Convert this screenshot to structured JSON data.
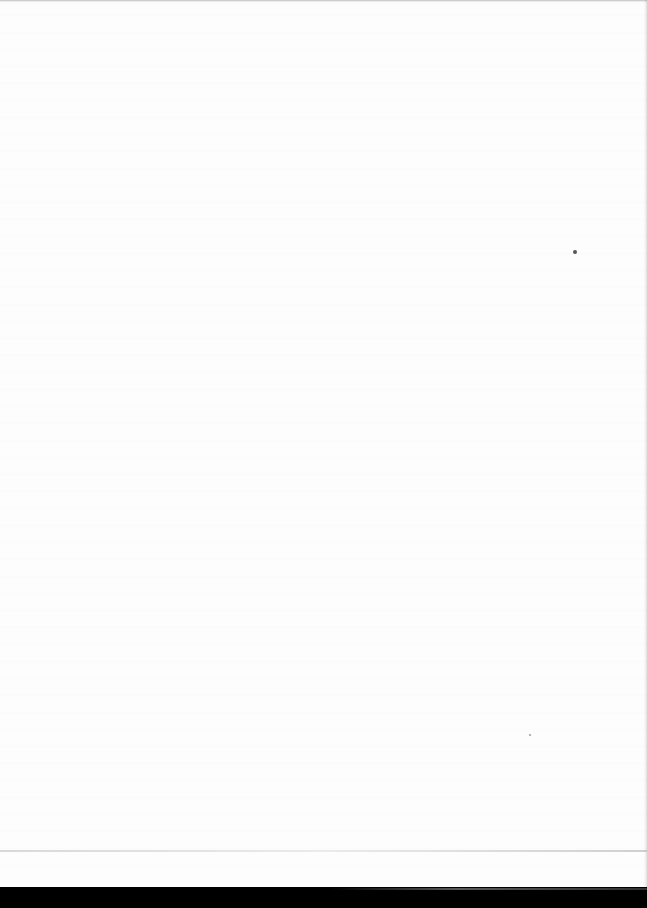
{
  "document": {
    "type": "blank scanned page",
    "visible_text": [],
    "colors": {
      "paper": "#fdfdfd",
      "background": "#000000",
      "speck": "#555555"
    }
  }
}
